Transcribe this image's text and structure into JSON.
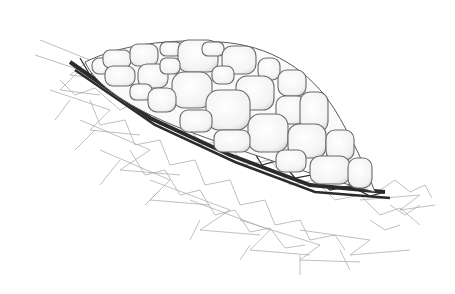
{
  "image": {
    "description": "Pen-and-ink scientific illustration of a dome of rounded polygonal cells resting on a dark fibrous band over a loose web-like mesh",
    "width": 455,
    "height": 294,
    "colors": {
      "background": "#ffffff",
      "cell_fill": "#fbfbfb",
      "cell_stroke": "#6e6e6e",
      "band": "#2a2a2a",
      "mesh": "#9a9a9a"
    }
  }
}
